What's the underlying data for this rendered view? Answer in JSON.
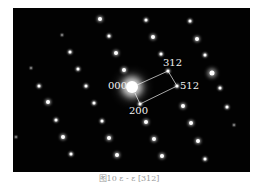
{
  "figure": {
    "background": "#020202",
    "spots": [
      {
        "x": 87,
        "y": 11,
        "size": "m"
      },
      {
        "x": 49,
        "y": 27,
        "size": "f"
      },
      {
        "x": 96,
        "y": 28,
        "size": "s"
      },
      {
        "x": 57,
        "y": 44,
        "size": "s"
      },
      {
        "x": 103,
        "y": 45,
        "size": "m"
      },
      {
        "x": 65,
        "y": 61,
        "size": "s"
      },
      {
        "x": 111,
        "y": 62,
        "size": "m"
      },
      {
        "x": 18,
        "y": 60,
        "size": "f"
      },
      {
        "x": 26,
        "y": 78,
        "size": "s"
      },
      {
        "x": 73,
        "y": 78,
        "size": "s"
      },
      {
        "x": 133,
        "y": 12,
        "size": "s"
      },
      {
        "x": 177,
        "y": 13,
        "size": "s"
      },
      {
        "x": 140,
        "y": 29,
        "size": "m"
      },
      {
        "x": 184,
        "y": 31,
        "size": "m"
      },
      {
        "x": 148,
        "y": 46,
        "size": "s"
      },
      {
        "x": 192,
        "y": 47,
        "size": "s"
      },
      {
        "x": 155,
        "y": 63,
        "size": "s"
      },
      {
        "x": 199,
        "y": 65,
        "size": "l"
      },
      {
        "x": 207,
        "y": 80,
        "size": "s"
      },
      {
        "x": 164,
        "y": 78,
        "size": "s"
      },
      {
        "x": 35,
        "y": 94,
        "size": "m"
      },
      {
        "x": 81,
        "y": 95,
        "size": "s"
      },
      {
        "x": 43,
        "y": 112,
        "size": "s"
      },
      {
        "x": 89,
        "y": 113,
        "size": "s"
      },
      {
        "x": 3,
        "y": 129,
        "size": "f"
      },
      {
        "x": 50,
        "y": 129,
        "size": "m"
      },
      {
        "x": 96,
        "y": 130,
        "size": "m"
      },
      {
        "x": 58,
        "y": 146,
        "size": "s"
      },
      {
        "x": 104,
        "y": 147,
        "size": "m"
      },
      {
        "x": 127,
        "y": 96,
        "size": "s"
      },
      {
        "x": 170,
        "y": 98,
        "size": "m"
      },
      {
        "x": 214,
        "y": 99,
        "size": "s"
      },
      {
        "x": 133,
        "y": 114,
        "size": "m"
      },
      {
        "x": 178,
        "y": 115,
        "size": "m"
      },
      {
        "x": 221,
        "y": 117,
        "size": "f"
      },
      {
        "x": 141,
        "y": 131,
        "size": "m"
      },
      {
        "x": 185,
        "y": 133,
        "size": "m"
      },
      {
        "x": 149,
        "y": 148,
        "size": "m"
      },
      {
        "x": 192,
        "y": 151,
        "size": "s"
      }
    ],
    "center_spot": {
      "x": 119,
      "y": 79
    },
    "parallelogram": {
      "points": "125,76 155,63 164,78 127,96 122,85",
      "stroke": "#d8d8d8"
    },
    "labels": {
      "origin": "000",
      "top_right": "312",
      "right": "512",
      "bottom": "200"
    }
  },
  "caption": "图10  ε - ε [312]"
}
